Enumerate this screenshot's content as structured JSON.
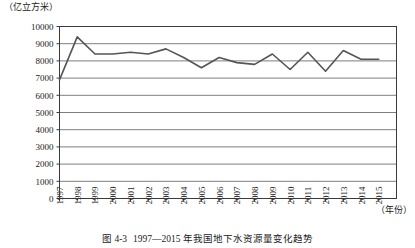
{
  "figure": {
    "caption_number": "图 4-3",
    "caption_text": "1997—2015 年我国地下水资源量变化趋势",
    "y_unit": "（亿立方米）",
    "x_unit": "（年份）"
  },
  "chart_data": {
    "type": "line",
    "title": "1997—2015 年我国地下水资源量变化趋势",
    "xlabel": "年份",
    "ylabel": "亿立方米",
    "ylim": [
      0,
      10000
    ],
    "ytick_step": 1000,
    "yticks": [
      0,
      1000,
      2000,
      3000,
      4000,
      5000,
      6000,
      7000,
      8000,
      9000,
      10000
    ],
    "ytick_labels": [
      "0",
      "1000",
      "2000",
      "3000",
      "4000",
      "5000",
      "6000",
      "7000",
      "8000",
      "9000",
      "10000"
    ],
    "grid": true,
    "grid_axis": "y",
    "legend": false,
    "marker": "none",
    "line_color": "#555555",
    "categories": [
      "1997",
      "1998",
      "1999",
      "2000",
      "2001",
      "2002",
      "2003",
      "2004",
      "2005",
      "2006",
      "2007",
      "2008",
      "2009",
      "2010",
      "2011",
      "2012",
      "2013",
      "2014",
      "2015"
    ],
    "x": [
      1997,
      1998,
      1999,
      2000,
      2001,
      2002,
      2003,
      2004,
      2005,
      2006,
      2007,
      2008,
      2009,
      2010,
      2011,
      2012,
      2013,
      2014,
      2015
    ],
    "values": [
      6900,
      9400,
      8400,
      8400,
      8500,
      8400,
      8700,
      8200,
      7600,
      8200,
      7900,
      7800,
      8400,
      7500,
      8500,
      7400,
      8600,
      8100,
      8100
    ],
    "series": [
      {
        "name": "地下水资源量",
        "values": [
          6900,
          9400,
          8400,
          8400,
          8500,
          8400,
          8700,
          8200,
          7600,
          8200,
          7900,
          7800,
          8400,
          7500,
          8500,
          7400,
          8600,
          8100,
          8100
        ]
      }
    ]
  },
  "colors": {
    "line": "#555555",
    "grid": "#6f6f6f",
    "axis": "#3a3a3a",
    "text": "#1a1a1a"
  }
}
